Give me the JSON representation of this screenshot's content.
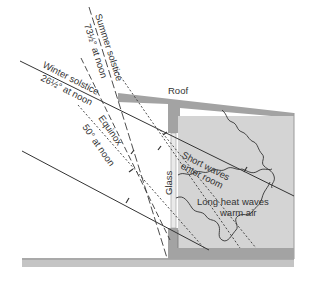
{
  "figure": {
    "labels": {
      "summer_line1": "Summer solstice",
      "summer_line2": "73½° at noon",
      "winter_line1": "Winter solstice",
      "winter_line2": "26½° at noon",
      "equinox_line1": "Equinox",
      "equinox_line2": "50° at noon",
      "roof": "Roof",
      "glass": "Glass",
      "short_waves_line1": "Short waves",
      "short_waves_line2": "enter room",
      "long_waves_line1": "Long heat waves",
      "long_waves_line2": "warm air"
    },
    "colors": {
      "structure_dark": "#9a9a9a",
      "room_fill": "#d2d2d2",
      "line": "#3a3a3a",
      "ground": "#bdbdbd"
    }
  }
}
